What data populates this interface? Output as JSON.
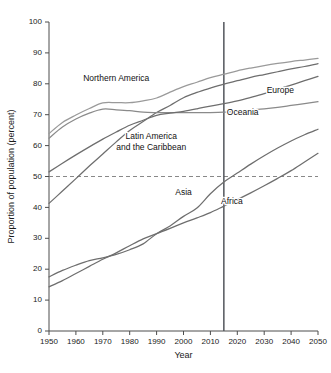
{
  "chart_data": {
    "type": "line",
    "title": "",
    "xlabel": "Year",
    "ylabel": "Proportion of population (percent)",
    "xlim": [
      1950,
      2050
    ],
    "ylim": [
      0,
      100
    ],
    "grid": false,
    "legend_position": "inline-labels",
    "x_ticks": [
      1950,
      1960,
      1970,
      1980,
      1990,
      2000,
      2010,
      2020,
      2030,
      2040,
      2050
    ],
    "y_ticks": [
      0,
      10,
      20,
      30,
      40,
      50,
      60,
      70,
      80,
      90,
      100
    ],
    "x_tick_labels": [
      "1950",
      "1960",
      "1970",
      "1980",
      "1990",
      "2000",
      "2010",
      "2020",
      "2030",
      "2040",
      "2050"
    ],
    "y_tick_labels": [
      "0",
      "10",
      "20",
      "30",
      "40",
      "50",
      "60",
      "70",
      "80",
      "90",
      "100"
    ],
    "annotations": [
      {
        "name": "fifty-percent-reference",
        "type": "hline",
        "value": 50,
        "style": "dashed",
        "color": "#7a7a7a"
      },
      {
        "name": "year-2015-reference",
        "type": "vline",
        "value": 2015,
        "style": "solid",
        "color": "#53565c"
      }
    ],
    "x": [
      1950,
      1955,
      1960,
      1965,
      1970,
      1975,
      1980,
      1985,
      1990,
      1995,
      2000,
      2005,
      2010,
      2015,
      2020,
      2025,
      2030,
      2035,
      2040,
      2045,
      2050
    ],
    "series": [
      {
        "name": "Northern America",
        "color": "#9a9a9a",
        "label": "Northern America",
        "label_x": 1975,
        "label_y": 81,
        "values": [
          63.9,
          67.5,
          69.9,
          72.0,
          73.8,
          73.9,
          73.9,
          74.5,
          75.4,
          77.3,
          79.1,
          80.5,
          82.0,
          83.1,
          84.2,
          85.1,
          85.9,
          86.6,
          87.2,
          87.7,
          88.2
        ]
      },
      {
        "name": "Latin America and the Caribbean",
        "color": "#6e6e6e",
        "label": "Latin America\nand the Caribbean",
        "label_x": 1988,
        "label_y": 62,
        "values": [
          41.3,
          45.3,
          49.3,
          53.4,
          57.3,
          61.2,
          64.9,
          67.8,
          70.7,
          73.0,
          75.5,
          77.2,
          78.6,
          79.9,
          81.0,
          82.1,
          83.0,
          83.9,
          84.8,
          85.6,
          86.5
        ]
      },
      {
        "name": "Oceania",
        "color": "#8a8a8a",
        "label": "Oceania",
        "label_x": 2022,
        "label_y": 70,
        "values": [
          62.4,
          66.0,
          68.6,
          70.5,
          71.8,
          71.6,
          71.3,
          70.8,
          70.7,
          70.7,
          70.7,
          70.7,
          70.7,
          70.8,
          71.1,
          71.5,
          71.9,
          72.4,
          73.0,
          73.6,
          74.2
        ]
      },
      {
        "name": "Europe",
        "color": "#6e6e6e",
        "label": "Europe",
        "label_x": 2036,
        "label_y": 77,
        "values": [
          51.5,
          54.3,
          57.0,
          59.6,
          62.1,
          64.4,
          66.6,
          68.2,
          69.8,
          70.5,
          71.1,
          71.9,
          72.8,
          73.6,
          74.5,
          75.6,
          76.8,
          78.2,
          79.6,
          81.0,
          82.4
        ]
      },
      {
        "name": "Asia",
        "color": "#6e6e6e",
        "label": "Asia",
        "label_x": 2000,
        "label_y": 44,
        "values": [
          17.5,
          19.6,
          21.3,
          22.8,
          23.7,
          24.8,
          26.3,
          28.2,
          31.5,
          34.0,
          37.1,
          39.8,
          44.4,
          48.2,
          51.1,
          54.0,
          56.7,
          59.2,
          61.5,
          63.5,
          65.3
        ]
      },
      {
        "name": "Africa",
        "color": "#6e6e6e",
        "label": "Africa",
        "label_x": 2018,
        "label_y": 41,
        "values": [
          14.3,
          16.3,
          18.6,
          20.9,
          23.2,
          25.3,
          27.6,
          29.8,
          31.5,
          33.2,
          35.0,
          36.6,
          38.3,
          40.4,
          42.5,
          44.7,
          47.0,
          49.4,
          51.9,
          54.7,
          57.5
        ]
      }
    ]
  }
}
